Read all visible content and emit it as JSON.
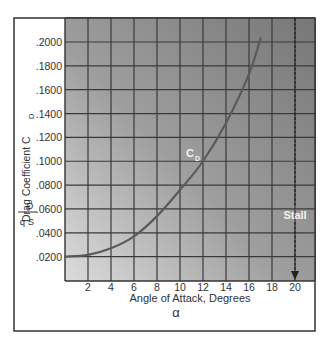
{
  "chart_data": {
    "type": "line",
    "title": "",
    "xlabel": "Angle of Attack, Degrees",
    "xlabel_symbol": "α",
    "ylabel": "Drag Coefficient  C",
    "ylabel_subscript": "D",
    "ylabel_formula": {
      "numerator": "D",
      "denominator": "q S"
    },
    "xlim": [
      0,
      20
    ],
    "ylim": [
      0.0,
      0.22
    ],
    "x_ticks": [
      "2",
      "4",
      "6",
      "8",
      "10",
      "12",
      "14",
      "16",
      "18",
      "20"
    ],
    "y_ticks": [
      ".0200",
      ".0400",
      ".0600",
      ".0800",
      ".1000",
      ".1200",
      ".1400",
      ".1600",
      ".1800",
      ".2000"
    ],
    "grid": true,
    "series": [
      {
        "name": "C_D",
        "label": "C",
        "label_subscript": "D",
        "x": [
          0,
          2,
          4,
          6,
          8,
          10,
          12,
          14,
          16,
          17
        ],
        "y": [
          0.02,
          0.0215,
          0.027,
          0.037,
          0.054,
          0.076,
          0.1,
          0.132,
          0.173,
          0.203
        ]
      }
    ],
    "annotations": [
      {
        "text": "Stall",
        "x": 20,
        "type": "vertical-arrow"
      }
    ],
    "legend": "none"
  },
  "labels": {
    "curve_label": "C",
    "curve_label_sub": "D",
    "stall": "Stall",
    "xlabel": "Angle of Attack, Degrees",
    "alpha": "α",
    "ylabel": "Drag Coefficient  C",
    "ylabel_sub": "D",
    "frac_num": "D",
    "frac_den": "q S"
  },
  "colors": {
    "plot_top": "#7a7a7a",
    "plot_bottom": "#d4d4d4",
    "grid": "#3a3a3a",
    "curve": "#5a5a5a",
    "frame": "#333333",
    "text": "#333333",
    "annotation_text": "#f2f2f2"
  }
}
